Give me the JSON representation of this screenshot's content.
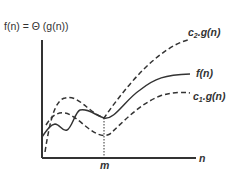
{
  "diagram": {
    "title": "f(n) = Θ (g(n))",
    "x_axis_label": "n",
    "marker_label": "m",
    "curves": [
      {
        "name": "upper-bound",
        "label_main": "c",
        "label_sub": "2",
        "label_rest": ".g(n)",
        "style": "dashed"
      },
      {
        "name": "function",
        "label": "f(n)",
        "style": "solid"
      },
      {
        "name": "lower-bound",
        "label_main": "c",
        "label_sub": "1",
        "label_rest": ".g(n)",
        "style": "dashed"
      }
    ],
    "colors": {
      "line": "#333333",
      "background": "#ffffff"
    }
  }
}
